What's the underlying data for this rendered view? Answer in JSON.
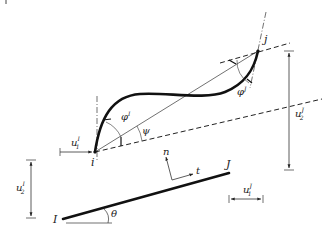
{
  "figure": {
    "type": "corotational beam element kinematics diagram",
    "nodes": {
      "deformed_start": "i",
      "deformed_end": "j",
      "initial_start": "I",
      "initial_end": "J"
    },
    "angles": {
      "rotation_i": {
        "symbol": "φ",
        "sup": "I"
      },
      "rotation_j": {
        "symbol": "φ",
        "sup": "J"
      },
      "rigid_rotation": "ψ",
      "initial_angle": "θ"
    },
    "local_axes": {
      "normal": "n",
      "tangent": "t"
    },
    "displacements": {
      "u1_I": {
        "base": "u",
        "sub": "1",
        "sup": "I"
      },
      "u2_I": {
        "base": "u",
        "sub": "2",
        "sup": "I"
      },
      "u1_J": {
        "base": "u",
        "sub": "1",
        "sup": "J"
      },
      "u2_J": {
        "base": "u",
        "sub": "2",
        "sup": "J"
      }
    },
    "colors": {
      "ink": "#1a1a1a",
      "thin": "#333333",
      "background": "#ffffff"
    }
  }
}
